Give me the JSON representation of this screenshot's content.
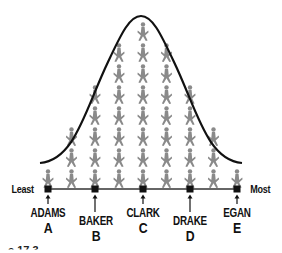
{
  "diagram": {
    "type": "normal-distribution-pictogram",
    "curve_color": "#111111",
    "figure_color": "#8a8a8a",
    "axis": {
      "left_label": "Least",
      "right_label": "Most"
    },
    "columns": [
      {
        "count": 1
      },
      {
        "count": 3
      },
      {
        "count": 5
      },
      {
        "count": 7
      },
      {
        "count": 8
      },
      {
        "count": 7
      },
      {
        "count": 5
      },
      {
        "count": 3
      },
      {
        "count": 1
      }
    ],
    "markers": [
      {
        "name": "ADAMS",
        "letter": "A"
      },
      {
        "name": "BAKER",
        "letter": "B"
      },
      {
        "name": "CLARK",
        "letter": "C"
      },
      {
        "name": "DRAKE",
        "letter": "D"
      },
      {
        "name": "EGAN",
        "letter": "E"
      }
    ],
    "caption_fragment": "e 17.3"
  }
}
